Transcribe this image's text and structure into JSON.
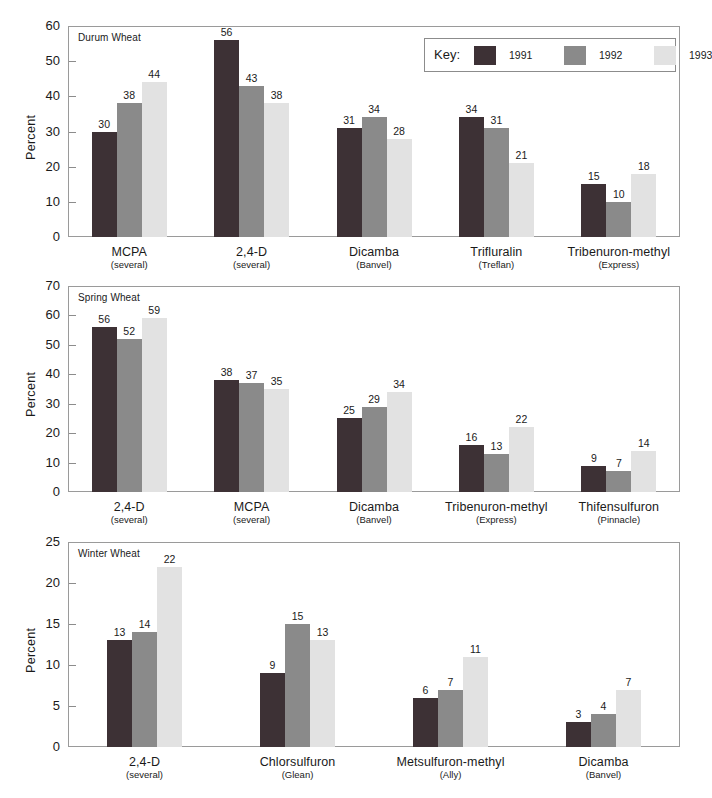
{
  "figure": {
    "legend": {
      "key_label": "Key:",
      "entries": [
        {
          "label": "1991",
          "color": "#3d3135"
        },
        {
          "label": "1992",
          "color": "#8a8a8a"
        },
        {
          "label": "1993",
          "color": "#e2e2e2"
        }
      ]
    }
  },
  "chart_data": [
    {
      "type": "bar",
      "title": "Durum Wheat",
      "xlabel": "",
      "ylabel": "Percent",
      "ylim": [
        0,
        60
      ],
      "yticks": [
        0,
        10,
        20,
        30,
        40,
        50,
        60
      ],
      "grid": false,
      "legend_position": "top-right",
      "categories": [
        "MCPA",
        "2,4-D",
        "Dicamba",
        "Trifluralin",
        "Tribenuron-methyl"
      ],
      "category_subs": [
        "(several)",
        "(several)",
        "(Banvel)",
        "(Treflan)",
        "(Express)"
      ],
      "series": [
        {
          "name": "1991",
          "values": [
            30,
            56,
            31,
            34,
            15
          ]
        },
        {
          "name": "1992",
          "values": [
            38,
            43,
            34,
            31,
            10
          ]
        },
        {
          "name": "1993",
          "values": [
            44,
            38,
            28,
            21,
            18
          ]
        }
      ]
    },
    {
      "type": "bar",
      "title": "Spring Wheat",
      "xlabel": "",
      "ylabel": "Percent",
      "ylim": [
        0,
        70
      ],
      "yticks": [
        0,
        10,
        20,
        30,
        40,
        50,
        60,
        70
      ],
      "grid": false,
      "legend_position": "none",
      "categories": [
        "2,4-D",
        "MCPA",
        "Dicamba",
        "Tribenuron-methyl",
        "Thifensulfuron"
      ],
      "category_subs": [
        "(several)",
        "(several)",
        "(Banvel)",
        "(Express)",
        "(Pinnacle)"
      ],
      "series": [
        {
          "name": "1991",
          "values": [
            56,
            38,
            25,
            16,
            9
          ]
        },
        {
          "name": "1992",
          "values": [
            52,
            37,
            29,
            13,
            7
          ]
        },
        {
          "name": "1993",
          "values": [
            59,
            35,
            34,
            22,
            14
          ]
        }
      ]
    },
    {
      "type": "bar",
      "title": "Winter Wheat",
      "xlabel": "",
      "ylabel": "Percent",
      "ylim": [
        0,
        25
      ],
      "yticks": [
        0,
        5,
        10,
        15,
        20,
        25
      ],
      "grid": false,
      "legend_position": "none",
      "categories": [
        "2,4-D",
        "Chlorsulfuron",
        "Metsulfuron-methyl",
        "Dicamba"
      ],
      "category_subs": [
        "(several)",
        "(Glean)",
        "(Ally)",
        "(Banvel)"
      ],
      "series": [
        {
          "name": "1991",
          "values": [
            13,
            9,
            6,
            3
          ]
        },
        {
          "name": "1992",
          "values": [
            14,
            15,
            7,
            4
          ]
        },
        {
          "name": "1993",
          "values": [
            22,
            13,
            11,
            7
          ]
        }
      ]
    }
  ]
}
